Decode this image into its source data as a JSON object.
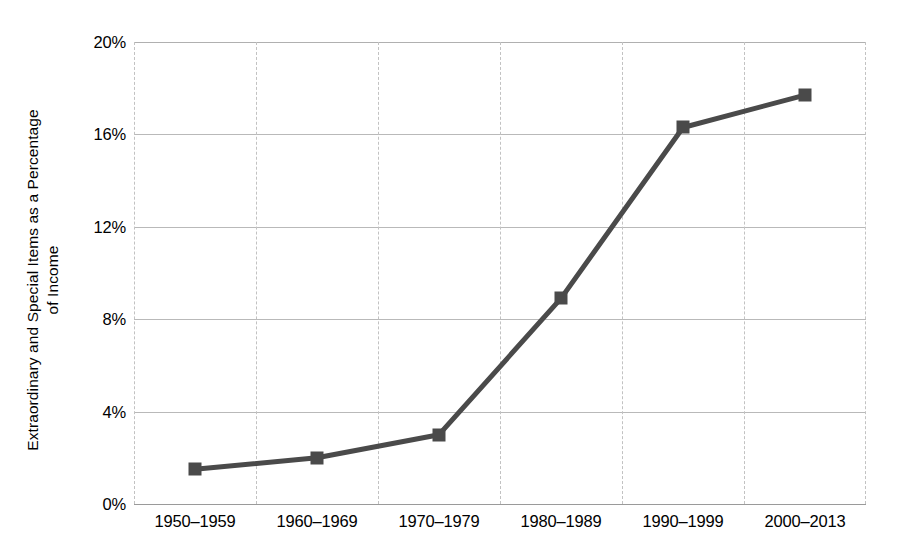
{
  "chart_data": {
    "type": "line",
    "title": "",
    "xlabel": "",
    "ylabel": "Extraordinary and Special Items as a Percentage of Income",
    "ylabel_line1": "Extraordinary and Special Items as a Percentage",
    "ylabel_line2": "of Income",
    "categories": [
      "1950–1959",
      "1960–1969",
      "1970–1979",
      "1980–1989",
      "1990–1999",
      "2000–2013"
    ],
    "values": [
      1.5,
      2.0,
      3.0,
      8.9,
      16.3,
      17.7
    ],
    "ylim": [
      0,
      20
    ],
    "yticks": [
      0,
      4,
      8,
      12,
      16,
      20
    ],
    "ytick_labels": [
      "0%",
      "4%",
      "8%",
      "12%",
      "16%",
      "20%"
    ],
    "grid": {
      "horizontal": true,
      "vertical": true,
      "vertical_style": "dashed"
    },
    "legend": {
      "visible": false,
      "position": "none"
    },
    "series": [
      {
        "name": "Extraordinary and Special Items as a Percentage of Income",
        "marker": "square",
        "values": [
          1.5,
          2.0,
          3.0,
          8.9,
          16.3,
          17.7
        ]
      }
    ]
  },
  "colors": {
    "line": "#4a4a4a",
    "marker": "#4a4a4a",
    "gridline": "#b9b9b9",
    "vertical_gridline": "#c2c2c2",
    "background": "#ffffff",
    "text": "#000000"
  }
}
